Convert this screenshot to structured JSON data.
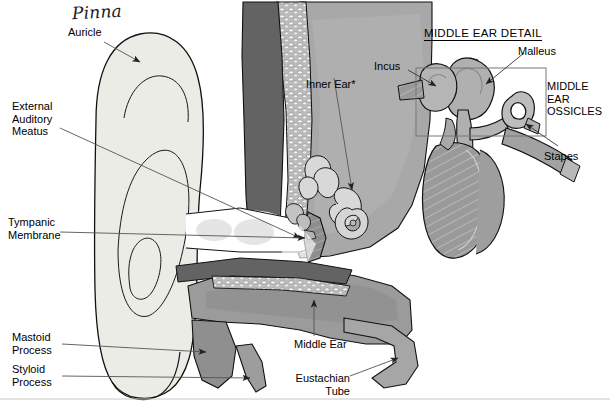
{
  "diagram": {
    "title_detail": "MIDDLE EAR DETAIL",
    "handwritten_note": "Pinna",
    "labels": {
      "auricle": "Auricle",
      "external_auditory_meatus": "External\nAuditory\nMeatus",
      "tympanic_membrane": "Tympanic\nMembrane",
      "mastoid_process": "Mastoid\nProcess",
      "styloid_process": "Styloid\nProcess",
      "inner_ear": "Inner Ear*",
      "middle_ear": "Middle Ear",
      "eustachian_tube": "Eustachian\nTube",
      "incus": "Incus",
      "malleus": "Malleus",
      "stapes": "Stapes",
      "ossicles": "MIDDLE\nEAR\nOSSICLES"
    },
    "caption": "",
    "caption_handwritten": "",
    "colors": {
      "auricle_fill": "#ecece7",
      "cartilage_dark": "#636363",
      "bone_speckle": "#b9b9b9",
      "temporal_bone": "#a8a8a8",
      "middle_ear_cavity": "#9b9b9b",
      "ossicle_fill": "#b0b0b0",
      "membrane_fill": "#8f8f8f",
      "outline": "#000000",
      "leader_line": "#555555"
    }
  }
}
